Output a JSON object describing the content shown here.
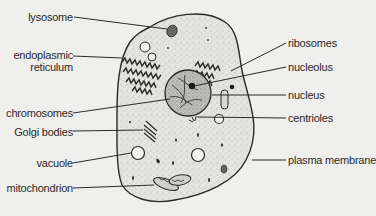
{
  "diagram": {
    "type": "animal cell",
    "colors": {
      "background": "#efefed",
      "ink": "#2a2a2a",
      "cytoplasm": "#e2e2df",
      "nucleus": "#b8b8b5"
    }
  },
  "labels": {
    "left": [
      {
        "id": "lysosome",
        "text": "lysosome",
        "line2": ""
      },
      {
        "id": "endoplasmic-reticulum",
        "text": "endoplasmic",
        "line2": "reticulum"
      },
      {
        "id": "chromosomes",
        "text": "chromosomes",
        "line2": ""
      },
      {
        "id": "golgi-bodies",
        "text": "Golgi  bodies",
        "line2": ""
      },
      {
        "id": "vacuole",
        "text": "vacuole",
        "line2": ""
      },
      {
        "id": "mitochondrion",
        "text": "mitochondrion",
        "line2": ""
      }
    ],
    "right": [
      {
        "id": "ribosomes",
        "text": "ribosomes"
      },
      {
        "id": "nucleolus",
        "text": "nucleolus"
      },
      {
        "id": "nucleus",
        "text": "nucleus"
      },
      {
        "id": "centrioles",
        "text": "centrioles"
      },
      {
        "id": "plasma-membrane",
        "text": "plasma membrane"
      }
    ]
  }
}
